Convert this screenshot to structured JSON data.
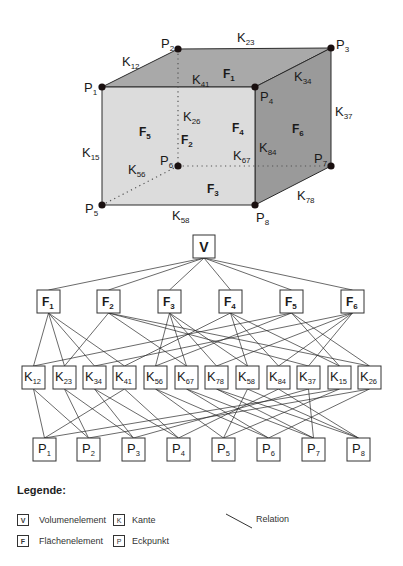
{
  "cube": {
    "colors": {
      "front": "#dcdcdc",
      "top": "#a9a9a9",
      "right": "#9a9a9a",
      "edge": "#2a2a2a",
      "vertex": "#1a1010"
    },
    "vertices": [
      {
        "id": "P1",
        "base": "P",
        "sub": "1",
        "x": 102,
        "y": 87,
        "lx": 84,
        "ly": 92
      },
      {
        "id": "P2",
        "base": "P",
        "sub": "2",
        "x": 178,
        "y": 49,
        "lx": 161,
        "ly": 48
      },
      {
        "id": "P3",
        "base": "P",
        "sub": "3",
        "x": 331,
        "y": 48,
        "lx": 336,
        "ly": 49
      },
      {
        "id": "P4",
        "base": "P",
        "sub": "4",
        "x": 255,
        "y": 87,
        "lx": 260,
        "ly": 101
      },
      {
        "id": "P5",
        "base": "P",
        "sub": "5",
        "x": 102,
        "y": 205,
        "lx": 85,
        "ly": 213
      },
      {
        "id": "P6",
        "base": "P",
        "sub": "6",
        "x": 178,
        "y": 166,
        "lx": 160,
        "ly": 165
      },
      {
        "id": "P7",
        "base": "P",
        "sub": "7",
        "x": 331,
        "y": 166,
        "lx": 314,
        "ly": 163
      },
      {
        "id": "P8",
        "base": "P",
        "sub": "8",
        "x": 255,
        "y": 205,
        "lx": 256,
        "ly": 222
      }
    ],
    "edge_labels": [
      {
        "base": "K",
        "sub": "12",
        "x": 122,
        "y": 66
      },
      {
        "base": "K",
        "sub": "23",
        "x": 237,
        "y": 42
      },
      {
        "base": "K",
        "sub": "41",
        "x": 192,
        "y": 84
      },
      {
        "base": "K",
        "sub": "34",
        "x": 294,
        "y": 81
      },
      {
        "base": "K",
        "sub": "37",
        "x": 335,
        "y": 116
      },
      {
        "base": "K",
        "sub": "26",
        "x": 183,
        "y": 121
      },
      {
        "base": "K",
        "sub": "15",
        "x": 82,
        "y": 157
      },
      {
        "base": "K",
        "sub": "67",
        "x": 233,
        "y": 160
      },
      {
        "base": "K",
        "sub": "84",
        "x": 259,
        "y": 152
      },
      {
        "base": "K",
        "sub": "56",
        "x": 128,
        "y": 174
      },
      {
        "base": "K",
        "sub": "78",
        "x": 297,
        "y": 200
      },
      {
        "base": "K",
        "sub": "58",
        "x": 172,
        "y": 220
      }
    ],
    "face_labels": [
      {
        "base": "F",
        "sub": "1",
        "x": 223,
        "y": 78
      },
      {
        "base": "F",
        "sub": "5",
        "x": 139,
        "y": 136
      },
      {
        "base": "F",
        "sub": "4",
        "x": 232,
        "y": 132
      },
      {
        "base": "F",
        "sub": "2",
        "x": 181,
        "y": 144
      },
      {
        "base": "F",
        "sub": "6",
        "x": 292,
        "y": 133
      },
      {
        "base": "F",
        "sub": "3",
        "x": 207,
        "y": 193
      }
    ]
  },
  "graph": {
    "volume": {
      "id": "V",
      "label": "V",
      "x": 193,
      "y": 235,
      "w": 22,
      "h": 23
    },
    "faces": [
      {
        "id": "F1",
        "base": "F",
        "sub": "1",
        "x": 37,
        "y": 290,
        "edges": [
          "K12",
          "K23",
          "K34",
          "K41"
        ]
      },
      {
        "id": "F2",
        "base": "F",
        "sub": "2",
        "x": 97,
        "y": 290,
        "edges": [
          "K23",
          "K37",
          "K67",
          "K26"
        ]
      },
      {
        "id": "F3",
        "base": "F",
        "sub": "3",
        "x": 158,
        "y": 290,
        "edges": [
          "K56",
          "K67",
          "K78",
          "K58"
        ]
      },
      {
        "id": "F4",
        "base": "F",
        "sub": "4",
        "x": 219,
        "y": 290,
        "edges": [
          "K41",
          "K84",
          "K58",
          "K15"
        ]
      },
      {
        "id": "F5",
        "base": "F",
        "sub": "5",
        "x": 280,
        "y": 290,
        "edges": [
          "K12",
          "K26",
          "K56",
          "K15"
        ]
      },
      {
        "id": "F6",
        "base": "F",
        "sub": "6",
        "x": 341,
        "y": 290,
        "edges": [
          "K34",
          "K37",
          "K78",
          "K84"
        ]
      }
    ],
    "edges": [
      {
        "id": "K12",
        "base": "K",
        "sub": "12",
        "x": 22,
        "y": 366,
        "points": [
          "P1",
          "P2"
        ]
      },
      {
        "id": "K23",
        "base": "K",
        "sub": "23",
        "x": 53,
        "y": 366,
        "points": [
          "P2",
          "P3"
        ]
      },
      {
        "id": "K34",
        "base": "K",
        "sub": "34",
        "x": 83,
        "y": 366,
        "points": [
          "P3",
          "P4"
        ]
      },
      {
        "id": "K41",
        "base": "K",
        "sub": "41",
        "x": 113,
        "y": 366,
        "points": [
          "P4",
          "P1"
        ]
      },
      {
        "id": "K56",
        "base": "K",
        "sub": "56",
        "x": 144,
        "y": 366,
        "points": [
          "P5",
          "P6"
        ]
      },
      {
        "id": "K67",
        "base": "K",
        "sub": "67",
        "x": 175,
        "y": 366,
        "points": [
          "P6",
          "P7"
        ]
      },
      {
        "id": "K78",
        "base": "K",
        "sub": "78",
        "x": 205,
        "y": 366,
        "points": [
          "P7",
          "P8"
        ]
      },
      {
        "id": "K58",
        "base": "K",
        "sub": "58",
        "x": 236,
        "y": 366,
        "points": [
          "P5",
          "P8"
        ]
      },
      {
        "id": "K84",
        "base": "K",
        "sub": "84",
        "x": 267,
        "y": 366,
        "points": [
          "P8",
          "P4"
        ]
      },
      {
        "id": "K37",
        "base": "K",
        "sub": "37",
        "x": 297,
        "y": 366,
        "points": [
          "P3",
          "P7"
        ]
      },
      {
        "id": "K15",
        "base": "K",
        "sub": "15",
        "x": 328,
        "y": 366,
        "points": [
          "P1",
          "P5"
        ]
      },
      {
        "id": "K26",
        "base": "K",
        "sub": "26",
        "x": 358,
        "y": 366,
        "points": [
          "P2",
          "P6"
        ]
      }
    ],
    "points": [
      {
        "id": "P1",
        "base": "P",
        "sub": "1",
        "x": 33,
        "y": 438
      },
      {
        "id": "P2",
        "base": "P",
        "sub": "2",
        "x": 77,
        "y": 438
      },
      {
        "id": "P3",
        "base": "P",
        "sub": "3",
        "x": 122,
        "y": 438
      },
      {
        "id": "P4",
        "base": "P",
        "sub": "4",
        "x": 167,
        "y": 438
      },
      {
        "id": "P5",
        "base": "P",
        "sub": "5",
        "x": 212,
        "y": 438
      },
      {
        "id": "P6",
        "base": "P",
        "sub": "6",
        "x": 257,
        "y": 438
      },
      {
        "id": "P7",
        "base": "P",
        "sub": "7",
        "x": 302,
        "y": 438
      },
      {
        "id": "P8",
        "base": "P",
        "sub": "8",
        "x": 347,
        "y": 438
      }
    ],
    "box_w": 23,
    "box_h": 23
  },
  "legend": {
    "title": "Legende:",
    "items": [
      {
        "symbol": "V",
        "label": "Volumenelement"
      },
      {
        "symbol": "F",
        "label": "Flächenelement"
      },
      {
        "symbol": "K",
        "label": "Kante"
      },
      {
        "symbol": "P",
        "label": "Eckpunkt"
      }
    ],
    "relation_label": "Relation"
  }
}
